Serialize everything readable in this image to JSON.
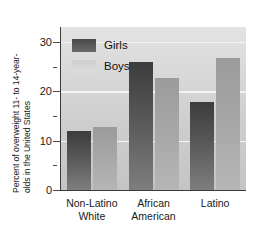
{
  "chart_data": {
    "type": "bar",
    "title": "",
    "xlabel": "",
    "ylabel_line1": "Percent of overweight 11- to 14-year-",
    "ylabel_line2": "olds in the United States",
    "ylim": [
      0,
      33
    ],
    "yticks_major": [
      0,
      10,
      20,
      30
    ],
    "yticks_minor": [
      5,
      15,
      25
    ],
    "gridlines": [
      10,
      20,
      30
    ],
    "grid": true,
    "legend_position": "upper-left-inside",
    "categories": [
      "Non-Latino White",
      "African American",
      "Latino"
    ],
    "category_lines": [
      [
        "Non-Latino",
        "White"
      ],
      [
        "African",
        "American"
      ],
      [
        "Latino",
        ""
      ]
    ],
    "series": [
      {
        "name": "Girls",
        "color": "#585858",
        "values": [
          12.0,
          26.0,
          17.8
        ]
      },
      {
        "name": "Boys",
        "color": "#a6a6a6",
        "values": [
          12.7,
          22.6,
          26.8
        ]
      }
    ]
  },
  "axis": {
    "ytick_labels": [
      "30",
      "20",
      "10",
      "0"
    ]
  },
  "legend": {
    "items": [
      {
        "label": "Girls"
      },
      {
        "label": "Boys"
      }
    ]
  }
}
